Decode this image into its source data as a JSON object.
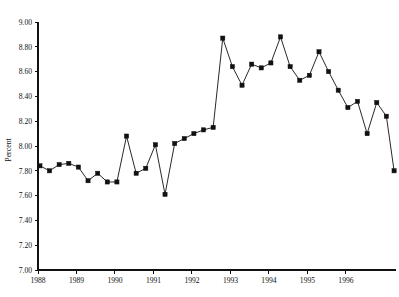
{
  "chart_data": {
    "type": "line",
    "title": "",
    "subtitle": "",
    "xlabel": "",
    "ylabel": "Percent",
    "ylim": [
      7.0,
      9.0
    ],
    "xlim": [
      1988.0,
      1997.3
    ],
    "grid": false,
    "legend": null,
    "marker": "filled-square",
    "line_color": "#111111",
    "marker_color": "#111111",
    "background_color": "#ffffff",
    "y_ticks": [
      "7.00",
      "7.20",
      "7.40",
      "7.60",
      "7.80",
      "8.00",
      "8.20",
      "8.40",
      "8.60",
      "8.80",
      "9.00"
    ],
    "y_tick_values": [
      7.0,
      7.2,
      7.4,
      7.6,
      7.8,
      8.0,
      8.2,
      8.4,
      8.6,
      8.8,
      9.0
    ],
    "x_ticks": [
      "1988",
      "1989",
      "1990",
      "1991",
      "1992",
      "1993",
      "1994",
      "1995",
      "1996"
    ],
    "x_tick_values": [
      1988,
      1989,
      1990,
      1991,
      1992,
      1993,
      1994,
      1995,
      1996
    ],
    "x": [
      1988.05,
      1988.3,
      1988.55,
      1988.8,
      1989.05,
      1989.3,
      1989.55,
      1989.8,
      1990.05,
      1990.3,
      1990.55,
      1990.8,
      1991.05,
      1991.3,
      1991.55,
      1991.8,
      1992.05,
      1992.3,
      1992.55,
      1992.8,
      1993.05,
      1993.3,
      1993.55,
      1993.8,
      1994.05,
      1994.3,
      1994.55,
      1994.8,
      1995.05,
      1995.3,
      1995.55,
      1995.8,
      1996.05,
      1996.3,
      1996.55,
      1996.8,
      1997.05,
      1997.25
    ],
    "values": [
      7.84,
      7.8,
      7.85,
      7.86,
      7.83,
      7.72,
      7.78,
      7.71,
      7.71,
      8.08,
      7.78,
      7.82,
      8.01,
      7.61,
      8.02,
      8.06,
      8.1,
      8.13,
      8.15,
      8.87,
      8.64,
      8.49,
      8.66,
      8.63,
      8.67,
      8.88,
      8.64,
      8.53,
      8.57,
      8.76,
      8.6,
      8.45,
      8.31,
      8.36,
      8.1,
      8.35,
      8.24,
      7.8
    ]
  }
}
